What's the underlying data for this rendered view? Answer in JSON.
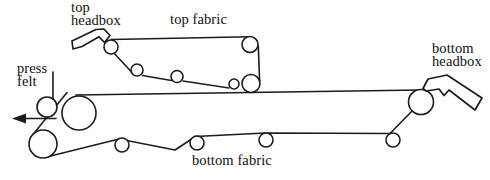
{
  "labels": {
    "top_headbox": "top\nheadbox",
    "top_fabric": "top fabric",
    "bottom_headbox": "bottom\nheadbox",
    "press_felt": "press\nfelt",
    "bottom_fabric": "bottom fabric"
  },
  "colors": {
    "line": "#1c1c1c",
    "background": "#ffffff",
    "text": "#111111"
  }
}
